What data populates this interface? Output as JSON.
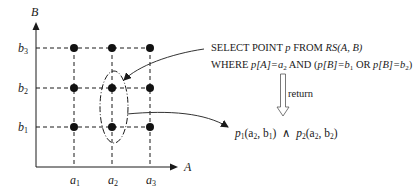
{
  "diagram": {
    "axes": {
      "x_label": "A",
      "y_label": "B"
    },
    "x_ticks": [
      {
        "base": "a",
        "sub": "1"
      },
      {
        "base": "a",
        "sub": "2"
      },
      {
        "base": "a",
        "sub": "3"
      }
    ],
    "y_ticks": [
      {
        "base": "b",
        "sub": "3"
      },
      {
        "base": "b",
        "sub": "2"
      },
      {
        "base": "b",
        "sub": "1"
      }
    ],
    "grid_points": "3x3 lattice of points at (a_i, b_j)",
    "highlight": "dashed ellipse around points (a2,b1) and (a2,b2)",
    "query": {
      "line1": {
        "kw1": "SELECT POINT ",
        "var": "p",
        "kw2": " FROM ",
        "rel": "RS",
        "args": "(A, B)"
      },
      "line2": {
        "kw1": "WHERE ",
        "p1": "p",
        "attrA": "[A]",
        "eq1": "=a",
        "sub1": "2",
        "and": " AND (",
        "p2": "p",
        "attrB1": "[B]",
        "eq2": "=b",
        "sub2": "1",
        "or": " OR ",
        "p3": "p",
        "attrB2": "[B]",
        "eq3": "=b",
        "sub3": "2",
        "close": ")"
      }
    },
    "return_label": "return",
    "result": {
      "p1": "p",
      "p1_sub": "1",
      "p1_args_a": "(a",
      "p1_args_a_sub": "2",
      "p1_args_b": ", b",
      "p1_args_b_sub": "1",
      "p1_close": ")",
      "op": "  ∧  ",
      "p2": "p",
      "p2_sub": "2",
      "p2_args_a": "(a",
      "p2_args_a_sub": "2",
      "p2_args_b": ", b",
      "p2_args_b_sub": "2",
      "p2_close": ")"
    }
  }
}
